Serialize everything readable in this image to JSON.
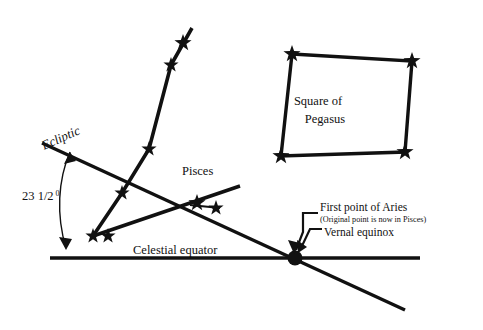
{
  "canvas": {
    "width": 483,
    "height": 330,
    "background": "#ffffff",
    "ink": "#111111"
  },
  "labels": {
    "ecliptic": "Ecliptic",
    "angle_value": "23 1/2",
    "angle_degree_symbol": "0",
    "pisces": "Pisces",
    "celestial_equator": "Celestial equator",
    "pegasus_line1": "Square of",
    "pegasus_line2": "Pegasus",
    "first_point_of_aries": "First point of Aries",
    "aries_note": "(Original point is now in Pisces)",
    "vernal_equinox": "Vernal equinox"
  },
  "geometry": {
    "celestial_equator_line": {
      "x1": 50,
      "y1": 258,
      "x2": 420,
      "y2": 258,
      "width": 3.4
    },
    "ecliptic_line": {
      "x1": 42,
      "y1": 143,
      "x2": 405,
      "y2": 310,
      "width": 3.4
    },
    "equinox_point": {
      "cx": 295,
      "cy": 258,
      "r": 7.5
    },
    "angle_arc": "M 70 152 C 58 180, 56 215, 66 248",
    "pisces_chain_upper": [
      {
        "x": 192,
        "y": 28
      },
      {
        "x": 171,
        "y": 65
      },
      {
        "x": 149,
        "y": 149
      },
      {
        "x": 122,
        "y": 193
      },
      {
        "x": 93,
        "y": 236
      }
    ],
    "pisces_chain_lower": [
      {
        "x": 93,
        "y": 236
      },
      {
        "x": 240,
        "y": 186
      }
    ],
    "pisces_branch": [
      {
        "x": 190,
        "y": 205
      },
      {
        "x": 220,
        "y": 208
      }
    ],
    "pegasus_square": [
      {
        "x": 292,
        "y": 54
      },
      {
        "x": 412,
        "y": 61
      },
      {
        "x": 405,
        "y": 152
      },
      {
        "x": 281,
        "y": 156
      }
    ],
    "stars": [
      {
        "x": 183,
        "y": 43,
        "size": 9
      },
      {
        "x": 171,
        "y": 65,
        "size": 8
      },
      {
        "x": 149,
        "y": 149,
        "size": 8
      },
      {
        "x": 122,
        "y": 193,
        "size": 8
      },
      {
        "x": 93,
        "y": 236,
        "size": 8
      },
      {
        "x": 108,
        "y": 236,
        "size": 8
      },
      {
        "x": 197,
        "y": 203,
        "size": 9
      },
      {
        "x": 216,
        "y": 208,
        "size": 8
      },
      {
        "x": 292,
        "y": 54,
        "size": 9
      },
      {
        "x": 412,
        "y": 61,
        "size": 9
      },
      {
        "x": 405,
        "y": 152,
        "size": 9
      },
      {
        "x": 281,
        "y": 156,
        "size": 9
      }
    ],
    "leader_aries": "M 318 213 L 303 213 L 303 232 L 296 250",
    "leader_equinox": "M 322 229 L 310 229 L 301 248"
  },
  "text_positions": {
    "ecliptic": {
      "x": 44,
      "y": 150,
      "rotate": -24
    },
    "angle_value": {
      "x": 22,
      "y": 200
    },
    "pisces": {
      "x": 182,
      "y": 175
    },
    "celestial_equator": {
      "x": 133,
      "y": 254
    },
    "pegasus_line1": {
      "x": 318,
      "y": 105
    },
    "pegasus_line2": {
      "x": 325,
      "y": 123
    },
    "first_point_of_aries": {
      "x": 320,
      "y": 211
    },
    "aries_note": {
      "x": 320,
      "y": 222
    },
    "vernal_equinox": {
      "x": 324,
      "y": 236
    }
  }
}
